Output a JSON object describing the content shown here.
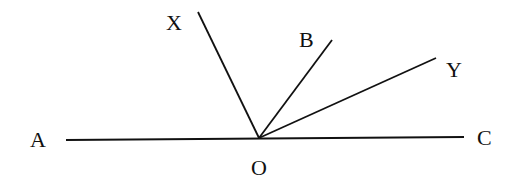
{
  "diagram": {
    "type": "geometry-angles",
    "points": {
      "A": {
        "label": "A"
      },
      "C": {
        "label": "C"
      },
      "O": {
        "label": "O"
      },
      "X": {
        "label": "X"
      },
      "B": {
        "label": "B"
      },
      "Y": {
        "label": "Y"
      }
    },
    "segments": [
      "AC",
      "OX",
      "OB",
      "OY"
    ],
    "colors": {
      "line": "#111111",
      "background": "#ffffff"
    }
  }
}
